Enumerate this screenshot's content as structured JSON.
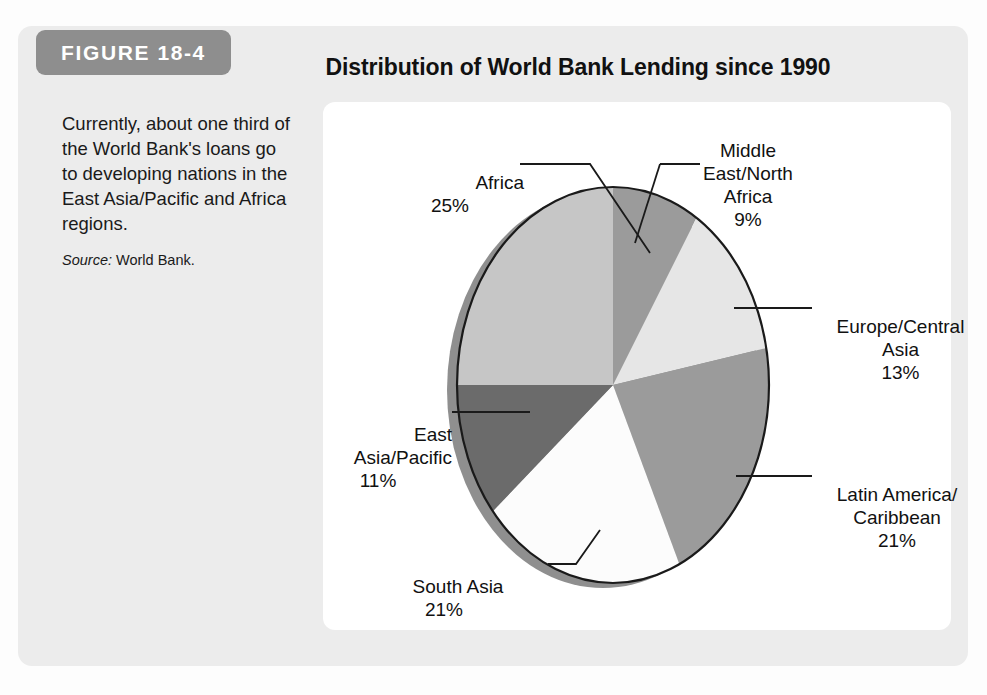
{
  "figure": {
    "badge_label": "FIGURE 18-4",
    "title": "Distribution of World Bank Lending since 1990",
    "caption": "Currently, about one third of the World Bank's loans go to developing nations in the East Asia/Pacific and Africa regions.",
    "source_label": "Source:",
    "source_value": "World Bank."
  },
  "colors": {
    "card_background": "#ececec",
    "panel_background": "#ffffff",
    "badge_background": "#8e8e8e",
    "badge_text": "#ffffff",
    "title_text": "#111111",
    "outline": "#1a1a1a",
    "pie_shadow": "#8f8f8f"
  },
  "chart_data": {
    "type": "pie",
    "title": "Distribution of World Bank Lending since 1990",
    "xlabel": "",
    "ylabel": "",
    "units": "percent",
    "start_angle_deg": 0,
    "direction": "clockwise",
    "legend": "none (direct callout labels)",
    "grid": false,
    "total": 100,
    "categories": [
      "Middle East/North Africa",
      "Europe/Central Asia",
      "Latin America/Caribbean",
      "South Asia",
      "East Asia/Pacific",
      "Africa"
    ],
    "values": [
      9,
      13,
      21,
      21,
      11,
      25
    ],
    "slices": [
      {
        "name": "Middle East/North Africa",
        "label_lines": "Middle\nEast/North\nAfrica",
        "value": 9,
        "display": "9%",
        "color": "#9b9b9b"
      },
      {
        "name": "Europe/Central Asia",
        "label_lines": "Europe/Central\nAsia",
        "value": 13,
        "display": "13%",
        "color": "#e6e6e6"
      },
      {
        "name": "Latin America/Caribbean",
        "label_lines": "Latin America/\nCaribbean",
        "value": 21,
        "display": "21%",
        "color": "#9b9b9b"
      },
      {
        "name": "South Asia",
        "label_lines": "South Asia",
        "value": 21,
        "display": "21%",
        "color": "#fcfcfc"
      },
      {
        "name": "East Asia/Pacific",
        "label_lines": "East\nAsia/Pacific",
        "value": 11,
        "display": "11%",
        "color": "#6b6b6b"
      },
      {
        "name": "Africa",
        "label_lines": "Africa",
        "value": 25,
        "display": "25%",
        "color": "#c6c6c6"
      }
    ]
  }
}
